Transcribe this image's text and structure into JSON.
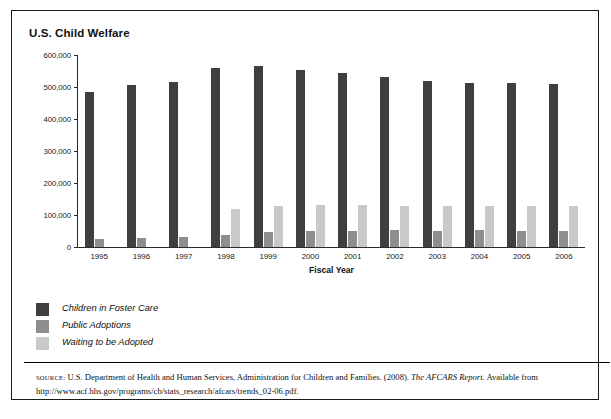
{
  "figure": {
    "title": "U.S. Child Welfare"
  },
  "chart_data": {
    "type": "bar",
    "title": "U.S. Child Welfare",
    "xlabel": "Fiscal Year",
    "ylabel": "",
    "grid": false,
    "legend_position": "below-left",
    "ylim": [
      0,
      600000
    ],
    "yticks": [
      0,
      100000,
      200000,
      300000,
      400000,
      500000,
      600000
    ],
    "ytick_labels": [
      "0",
      "100,000",
      "200,000",
      "300,000",
      "400,000",
      "500,000",
      "600,000"
    ],
    "categories": [
      "1995",
      "1996",
      "1997",
      "1998",
      "1999",
      "2000",
      "2001",
      "2002",
      "2003",
      "2004",
      "2005",
      "2006"
    ],
    "series": [
      {
        "name": "Children in Foster Care",
        "color": "#3f3f3f",
        "values": [
          483000,
          507000,
          516000,
          559000,
          567000,
          552000,
          545000,
          532000,
          518000,
          513000,
          511000,
          510000
        ]
      },
      {
        "name": "Public Adoptions",
        "color": "#8e8e8e",
        "values": [
          26000,
          28000,
          31000,
          37000,
          47000,
          51000,
          50000,
          53000,
          50000,
          52000,
          51000,
          51000
        ]
      },
      {
        "name": "Waiting to be Adopted",
        "color": "#c9c9c9",
        "values": [
          0,
          0,
          0,
          118000,
          127000,
          131000,
          131000,
          129000,
          128000,
          129000,
          129000,
          129000
        ]
      }
    ]
  },
  "legend": {
    "items": [
      {
        "label": "Children in Foster Care",
        "color": "#3f3f3f"
      },
      {
        "label": "Public Adoptions",
        "color": "#8e8e8e"
      },
      {
        "label": "Waiting to be Adopted",
        "color": "#c9c9c9"
      }
    ]
  },
  "source": {
    "kicker": "SOURCE:",
    "line1_a": " U.S. Department of Health and Human Services, Administration for Children and Families. (2008). ",
    "line1_italic": "The AFCARS Report",
    "line1_b": ".",
    "line2": "Available from http://www.acf.hhs.gov/programs/cb/stats_research/afcars/trends_02-06.pdf."
  }
}
